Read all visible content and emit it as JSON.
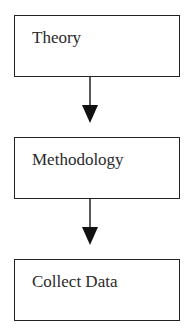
{
  "diagram": {
    "type": "flowchart",
    "direction": "top-to-bottom",
    "nodes": [
      {
        "id": "theory",
        "label": "Theory"
      },
      {
        "id": "methodology",
        "label": "Methodology"
      },
      {
        "id": "collect-data",
        "label": "Collect Data"
      }
    ],
    "edges": [
      {
        "from": "theory",
        "to": "methodology"
      },
      {
        "from": "methodology",
        "to": "collect-data"
      }
    ]
  }
}
